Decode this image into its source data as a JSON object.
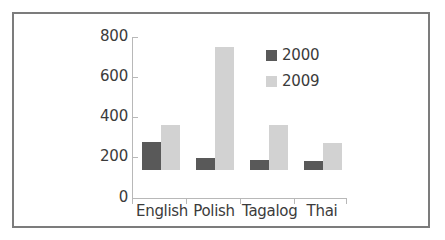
{
  "chart_data": {
    "type": "bar",
    "title": "",
    "subtitle": "",
    "xlabel": "",
    "ylabel": "",
    "categories": [
      "English",
      "Polish",
      "Tagalog",
      "Thai"
    ],
    "series": [
      {
        "name": "2000",
        "color": "#595959",
        "values": [
          140,
          60,
          50,
          45
        ]
      },
      {
        "name": "2009",
        "color": "#d2d2d2",
        "values": [
          225,
          610,
          225,
          135
        ]
      }
    ],
    "ylim": [
      0,
      800
    ],
    "yticks": [
      0,
      200,
      400,
      600,
      800
    ],
    "ytick_labels": [
      "0",
      "200",
      "400",
      "600",
      "800"
    ],
    "grid": false,
    "legend_position": "top-right",
    "annotations": []
  },
  "legend": {
    "items": [
      {
        "label": "2000",
        "color": "#595959"
      },
      {
        "label": "2009",
        "color": "#d2d2d2"
      }
    ]
  },
  "axis": {
    "y_labels": [
      "800",
      "600",
      "400",
      "200",
      "0"
    ],
    "x_labels": [
      "English",
      "Polish",
      "Tagalog",
      "Thai"
    ]
  },
  "colors": {
    "frame": "#7c7c7c",
    "axis": "#b8b8b8",
    "text": "#3b3b3b",
    "series_2000": "#595959",
    "series_2009": "#d2d2d2",
    "background": "#ffffff"
  }
}
